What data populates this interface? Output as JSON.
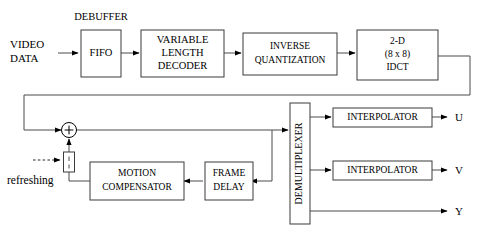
{
  "diagram": {
    "type": "block-diagram",
    "canvas": {
      "width": 478,
      "height": 239
    },
    "colors": {
      "background": "#ffffff",
      "block_stroke": "#3b3b3b",
      "wire": "#4a4a4a",
      "text": "#000000"
    }
  },
  "inputs": {
    "video_data_line1": "VIDEO",
    "video_data_line2": "DATA",
    "refreshing": "refreshing"
  },
  "annotations": {
    "debuffer": "DEBUFFER"
  },
  "blocks": {
    "fifo": {
      "label": "FIFO"
    },
    "vld": {
      "line1": "VARIABLE",
      "line2": "LENGTH",
      "line3": "DECODER"
    },
    "iq": {
      "line1": "INVERSE",
      "line2": "QUANTIZATION"
    },
    "idct": {
      "line1": "2-D",
      "line2": "(8 x 8)",
      "line3": "IDCT"
    },
    "demux": {
      "label": "DEMULTIPLEXER"
    },
    "interpolator_u": {
      "label": "INTERPOLATOR"
    },
    "interpolator_v": {
      "label": "INTERPOLATOR"
    },
    "motion_compensator": {
      "line1": "MOTION",
      "line2": "COMPENSATOR"
    },
    "frame_delay": {
      "line1": "FRAME",
      "line2": "DELAY"
    },
    "adder": {
      "symbol": "+"
    },
    "switch": {
      "label": ""
    }
  },
  "outputs": {
    "u": "U",
    "v": "V",
    "y": "Y"
  },
  "signal_flow": [
    "VIDEO DATA -> FIFO",
    "FIFO -> VARIABLE LENGTH DECODER",
    "VARIABLE LENGTH DECODER -> INVERSE QUANTIZATION",
    "INVERSE QUANTIZATION -> 2-D (8 x 8) IDCT",
    "2-D (8 x 8) IDCT -> adder (via feedback bus)",
    "adder -> DEMULTIPLEXER",
    "DEMULTIPLEXER -> INTERPOLATOR -> U",
    "DEMULTIPLEXER -> INTERPOLATOR -> V",
    "DEMULTIPLEXER -> Y",
    "DEMULTIPLEXER -> FRAME DELAY",
    "FRAME DELAY -> MOTION COMPENSATOR",
    "MOTION COMPENSATOR -> switch -> adder",
    "refreshing -> switch"
  ]
}
